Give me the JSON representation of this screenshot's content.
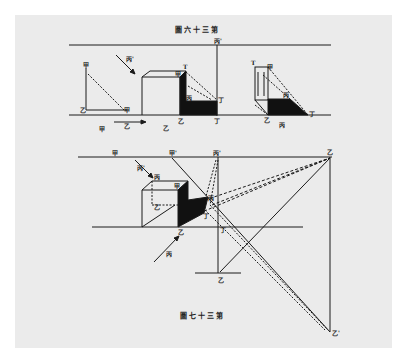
{
  "page": {
    "background": "#ffffff",
    "paper_color": "#ebebeb",
    "ink_color": "#1a1a1a"
  },
  "figures": [
    {
      "id": "fig36",
      "caption": "圖六十三第",
      "labels": {
        "top_right": "丙'",
        "left_top": "甲",
        "left_bottom": "乙",
        "left_corner": "甲",
        "arrow": "丙'",
        "cube_top": "T",
        "cube_corner": "甲",
        "shadow_mid": "丙",
        "shadow_right": "丁",
        "base_left": "乙",
        "base_right": "丁",
        "under_left": "甲",
        "under_arrow": "乙",
        "under_mid": "乙",
        "right_top": "T",
        "right_top2": "甲",
        "right_mid": "丙",
        "right_base": "乙",
        "right_base2": "丙",
        "right_end": "丁"
      }
    },
    {
      "id": "fig37",
      "caption": "圖七十三第",
      "labels": {
        "top_1": "甲",
        "top_2": "甲'",
        "top_3": "丙'",
        "top_right": "乙",
        "arrow_top": "丙'",
        "cube_a": "丙",
        "cube_b": "甲",
        "inner": "乙",
        "shadow_pt": "丙",
        "shadow_low": "丁",
        "base_pt": "乙",
        "ground_pt": "丁",
        "arrow_bottom": "丙",
        "bottom_pt": "乙",
        "far_pt": "乙'"
      }
    }
  ]
}
